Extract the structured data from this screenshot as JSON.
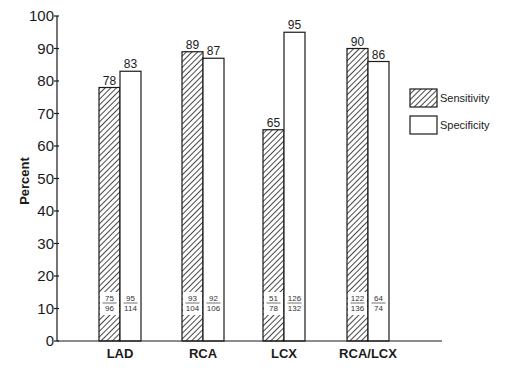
{
  "chart_data": {
    "type": "bar",
    "title": "",
    "xlabel": "",
    "ylabel": "Percent",
    "ylim": [
      0,
      100
    ],
    "yticks": [
      0,
      10,
      20,
      30,
      40,
      50,
      60,
      70,
      80,
      90,
      100
    ],
    "grid": false,
    "legend_position": "right",
    "categories": [
      "LAD",
      "RCA",
      "LCX",
      "RCA/LCX"
    ],
    "series": [
      {
        "name": "Sensitivity",
        "pattern": "diagonal-hatch",
        "values": [
          78,
          89,
          65,
          90
        ],
        "fractions": [
          [
            "75",
            "96"
          ],
          [
            "93",
            "104"
          ],
          [
            "51",
            "78"
          ],
          [
            "122",
            "136"
          ]
        ]
      },
      {
        "name": "Specificity",
        "pattern": "open",
        "values": [
          83,
          87,
          95,
          86
        ],
        "fractions": [
          [
            "95",
            "114"
          ],
          [
            "92",
            "106"
          ],
          [
            "126",
            "132"
          ],
          [
            "64",
            "74"
          ]
        ]
      }
    ]
  },
  "colors": {
    "ink": "#1a1a1a",
    "background": "#ffffff"
  }
}
